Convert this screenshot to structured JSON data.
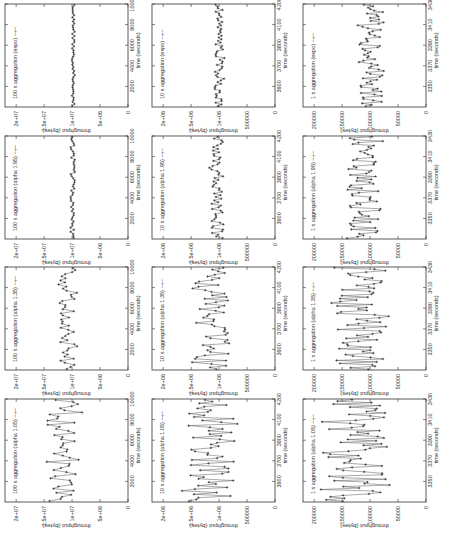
{
  "figure": {
    "orientation": "rotated-90-clockwise",
    "rows": [
      "expo",
      "alpha 1.95",
      "alpha 1.35",
      "alpha 1.05"
    ],
    "columns": [
      "100 s",
      "10 s",
      "1 s"
    ],
    "caption": ""
  },
  "chart_data": [
    {
      "type": "line",
      "panel": "r1c1",
      "title": "100 s aggregation (expo)",
      "legend": "100 s aggregation (expo)",
      "xlabel": "time (seconds)",
      "ylabel": "throughput (bytes)",
      "xticks": [
        "2000",
        "4000",
        "6000",
        "8000",
        "10000"
      ],
      "yticks": [
        "0",
        "5e+06",
        "1e+07",
        "1.5e+07",
        "2e+07"
      ],
      "xlim": [
        0,
        10000
      ],
      "ylim": [
        0,
        22000000
      ],
      "mean": 9800000,
      "spread": 250000,
      "points": 50,
      "seed": 11
    },
    {
      "type": "line",
      "panel": "r1c2",
      "title": "10 s aggregation (expo)",
      "legend": "10 s aggregation (expo)",
      "xlabel": "time (seconds)",
      "ylabel": "throughput (bytes)",
      "xticks": [
        "3600",
        "3700",
        "3800",
        "4100",
        "4200"
      ],
      "yticks": [
        "0",
        "500000",
        "1e+06",
        "1.5e+06",
        "2e+06"
      ],
      "xlim": [
        3500,
        4200
      ],
      "ylim": [
        0,
        2200000
      ],
      "mean": 1000000,
      "spread": 80000,
      "points": 60,
      "seed": 12
    },
    {
      "type": "line",
      "panel": "r1c3",
      "title": "1 s aggregation (expo)",
      "legend": "1 s aggregation (expo)",
      "xlabel": "time (seconds)",
      "ylabel": "throughput (bytes)",
      "xticks": [
        "3350",
        "3370",
        "3390",
        "3410",
        "3430"
      ],
      "yticks": [
        "0",
        "50000",
        "100000",
        "150000",
        "200000"
      ],
      "xlim": [
        3335,
        3435
      ],
      "ylim": [
        0,
        220000
      ],
      "mean": 100000,
      "spread": 22000,
      "points": 70,
      "seed": 13
    },
    {
      "type": "line",
      "panel": "r2c1",
      "title": "100 s aggregation (alpha 1.95)",
      "legend": "100 s aggregation (alpha 1.95)",
      "xlabel": "time (seconds)",
      "ylabel": "throughput (bytes)",
      "xticks": [
        "2000",
        "4000",
        "6000",
        "8000",
        "10000"
      ],
      "yticks": [
        "0",
        "5e+06",
        "1e+07",
        "1.5e+07",
        "2e+07"
      ],
      "xlim": [
        0,
        10000
      ],
      "ylim": [
        0,
        22000000
      ],
      "mean": 9900000,
      "spread": 350000,
      "points": 50,
      "seed": 21
    },
    {
      "type": "line",
      "panel": "r2c2",
      "title": "10 s aggregation (alpha 1.95)",
      "legend": "10 s aggregation (alpha 1.95)",
      "xlabel": "time (seconds)",
      "ylabel": "throughput (bytes)",
      "xticks": [
        "3600",
        "3700",
        "3800",
        "4100",
        "4200"
      ],
      "yticks": [
        "0",
        "500000",
        "1e+06",
        "1.5e+06",
        "2e+06"
      ],
      "xlim": [
        3500,
        4200
      ],
      "ylim": [
        0,
        2200000
      ],
      "mean": 1050000,
      "spread": 110000,
      "points": 60,
      "seed": 22
    },
    {
      "type": "line",
      "panel": "r2c3",
      "title": "1 s aggregation (alpha 1.95)",
      "legend": "1 s aggregation (alpha 1.95)",
      "xlabel": "time (seconds)",
      "ylabel": "throughput (bytes)",
      "xticks": [
        "3350",
        "3370",
        "3390",
        "3410",
        "3430"
      ],
      "yticks": [
        "0",
        "50000",
        "100000",
        "150000",
        "200000"
      ],
      "xlim": [
        3335,
        3435
      ],
      "ylim": [
        0,
        220000
      ],
      "mean": 110000,
      "spread": 30000,
      "points": 70,
      "seed": 23
    },
    {
      "type": "line",
      "panel": "r3c1",
      "title": "100 s aggregation (alpha 1.35)",
      "legend": "100 s aggregation (alpha 1.35)",
      "xlabel": "time (seconds)",
      "ylabel": "throughput (bytes)",
      "xticks": [
        "2000",
        "4000",
        "6000",
        "8000",
        "10000"
      ],
      "yticks": [
        "0",
        "5e+06",
        "1e+07",
        "1.5e+07",
        "2e+07"
      ],
      "xlim": [
        0,
        10000
      ],
      "ylim": [
        0,
        22000000
      ],
      "mean": 10800000,
      "spread": 1500000,
      "points": 50,
      "seed": 31
    },
    {
      "type": "line",
      "panel": "r3c2",
      "title": "10 s aggregation (alpha 1.35)",
      "legend": "10 s aggregation (alpha 1.35)",
      "xlabel": "time (seconds)",
      "ylabel": "throughput (bytes)",
      "xticks": [
        "3600",
        "3700",
        "3800",
        "4100",
        "4200"
      ],
      "yticks": [
        "0",
        "500000",
        "1e+06",
        "1.5e+06",
        "2e+06"
      ],
      "xlim": [
        3500,
        4200
      ],
      "ylim": [
        0,
        2200000
      ],
      "mean": 1150000,
      "spread": 300000,
      "points": 60,
      "seed": 32
    },
    {
      "type": "line",
      "panel": "r3c3",
      "title": "1 s aggregation (alpha 1.35)",
      "legend": "1 s aggregation (alpha 1.35)",
      "xlabel": "time (seconds)",
      "ylabel": "throughput (bytes)",
      "xticks": [
        "3350",
        "3370",
        "3390",
        "3410",
        "3430"
      ],
      "yticks": [
        "0",
        "50000",
        "100000",
        "150000",
        "200000"
      ],
      "xlim": [
        3335,
        3435
      ],
      "ylim": [
        0,
        220000
      ],
      "mean": 115000,
      "spread": 45000,
      "points": 70,
      "seed": 33
    },
    {
      "type": "line",
      "panel": "r4c1",
      "title": "100 s aggregation (alpha 1.05)",
      "legend": "100 s aggregation (alpha 1.05)",
      "xlabel": "time (seconds)",
      "ylabel": "throughput (bytes)",
      "xticks": [
        "2000",
        "4000",
        "6000",
        "8000",
        "10000"
      ],
      "yticks": [
        "0",
        "5e+06",
        "1e+07",
        "1.5e+07",
        "2e+07"
      ],
      "xlim": [
        0,
        10000
      ],
      "ylim": [
        0,
        22000000
      ],
      "mean": 11500000,
      "spread": 3200000,
      "points": 50,
      "seed": 41
    },
    {
      "type": "line",
      "panel": "r4c2",
      "title": "10 s aggregation (alpha 1.05)",
      "legend": "10 s aggregation (alpha 1.05)",
      "xlabel": "time (seconds)",
      "ylabel": "throughput (bytes)",
      "xticks": [
        "3600",
        "3700",
        "3800",
        "4100",
        "4200"
      ],
      "yticks": [
        "0",
        "500000",
        "1e+06",
        "1.5e+06",
        "2e+06"
      ],
      "xlim": [
        3500,
        4200
      ],
      "ylim": [
        0,
        2200000
      ],
      "mean": 1150000,
      "spread": 450000,
      "points": 60,
      "seed": 42
    },
    {
      "type": "line",
      "panel": "r4c3",
      "title": "1 s aggregation (alpha 1.05)",
      "legend": "1 s aggregation (alpha 1.05)",
      "xlabel": "time (seconds)",
      "ylabel": "throughput (bytes)",
      "xticks": [
        "3350",
        "3370",
        "3390",
        "3410",
        "3430"
      ],
      "yticks": [
        "0",
        "50000",
        "100000",
        "150000",
        "200000"
      ],
      "xlim": [
        3335,
        3435
      ],
      "ylim": [
        0,
        220000
      ],
      "mean": 125000,
      "spread": 55000,
      "points": 70,
      "seed": 43
    }
  ],
  "layout": {
    "col_x": [
      5,
      152,
      303
    ],
    "row_y": [
      4,
      136,
      267,
      399
    ],
    "frame_w": 123,
    "frame_h": 103
  }
}
